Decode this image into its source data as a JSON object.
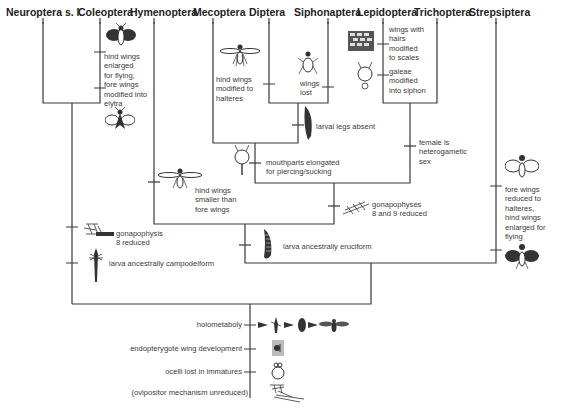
{
  "taxa": [
    {
      "name": "Neuroptera s. l.",
      "x": 6
    },
    {
      "name": "Coleoptera",
      "x": 78
    },
    {
      "name": "Hymenoptera",
      "x": 130
    },
    {
      "name": "Mecoptera",
      "x": 193
    },
    {
      "name": "Diptera",
      "x": 249
    },
    {
      "name": "Siphonaptera",
      "x": 294
    },
    {
      "name": "Lepidoptera",
      "x": 357
    },
    {
      "name": "Trichoptera",
      "x": 414
    },
    {
      "name": "Strepsiptera",
      "x": 469
    }
  ],
  "characters": {
    "coleoptera_wings": [
      "hind wings",
      "enlarged",
      "for flying,",
      "fore wings",
      "modified into",
      "elytra"
    ],
    "diptera_halteres": [
      "hind wings",
      "modified to",
      "halteres"
    ],
    "siphonaptera_wings": [
      "wings",
      "lost"
    ],
    "lepidoptera_scales": [
      "wings with",
      "hairs",
      "modified",
      "to scales"
    ],
    "lepidoptera_galeae": [
      "galeae",
      "modified",
      "into siphon"
    ],
    "larval_legs": "larval legs absent",
    "mouthparts": [
      "mouthparts elongated",
      "for piercing/sucking"
    ],
    "female_sex": [
      "female is",
      "heterogametic",
      "sex"
    ],
    "hymenoptera_wings": [
      "hind wings",
      "smaller than",
      "fore wings"
    ],
    "gonapophyses_8_9": [
      "gonapophyses",
      "8 and 9 reduced"
    ],
    "strepsiptera_wings": [
      "fore wings",
      "reduced to",
      "halteres,",
      "hind wings",
      "enlarged for",
      "flying"
    ],
    "gonapophysis_8": [
      "gonapophysis",
      "8 reduced"
    ],
    "larva_campodeiform": "larva ancestrally campodeiform",
    "larva_eruciform": "larva ancestrally eruciform",
    "holometaboly": "holometaboly",
    "wing_development": "endopterygote wing development",
    "ocelli": "ocelli lost in immatures",
    "ovipositor": "(ovipositor mechanism unreduced)"
  },
  "colors": {
    "line": "#3a3a3a",
    "text": "#2a2a2a",
    "icon_fill": "#333333",
    "background": "#ffffff"
  }
}
